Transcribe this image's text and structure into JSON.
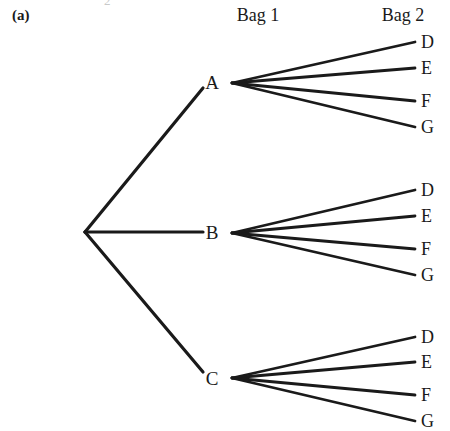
{
  "figure": {
    "part_label": "(a)",
    "top_artifact": "2",
    "background_color": "#ffffff",
    "line_color": "#1a1a1a",
    "text_color": "#1a1a1a"
  },
  "headers": [
    {
      "name": "bag-1",
      "label": "Bag 1",
      "x": 258
    },
    {
      "name": "bag-2",
      "label": "Bag 2",
      "x": 403
    }
  ],
  "root": {
    "x": 85,
    "y": 232
  },
  "stage1": [
    {
      "id": "A",
      "label": "A",
      "x": 212,
      "y": 82,
      "fan_x": 232,
      "fan_y": 83,
      "line_end_x": 203,
      "line_end_y": 88
    },
    {
      "id": "B",
      "label": "B",
      "x": 212,
      "y": 232,
      "fan_x": 232,
      "fan_y": 233,
      "line_end_x": 203,
      "line_end_y": 232
    },
    {
      "id": "C",
      "label": "C",
      "x": 212,
      "y": 378,
      "fan_x": 232,
      "fan_y": 378,
      "line_end_x": 203,
      "line_end_y": 372
    }
  ],
  "stage2": [
    {
      "parent": "A",
      "leaves": [
        {
          "label": "D",
          "y": 42,
          "line_x": 415,
          "text_x": 421
        },
        {
          "label": "E",
          "y": 68,
          "line_x": 415,
          "text_x": 421
        },
        {
          "label": "F",
          "y": 101,
          "line_x": 415,
          "text_x": 421
        },
        {
          "label": "G",
          "y": 127,
          "line_x": 415,
          "text_x": 421
        }
      ]
    },
    {
      "parent": "B",
      "leaves": [
        {
          "label": "D",
          "y": 190,
          "line_x": 415,
          "text_x": 421
        },
        {
          "label": "E",
          "y": 216,
          "line_x": 415,
          "text_x": 421
        },
        {
          "label": "F",
          "y": 249,
          "line_x": 415,
          "text_x": 421
        },
        {
          "label": "G",
          "y": 275,
          "line_x": 415,
          "text_x": 421
        }
      ]
    },
    {
      "parent": "C",
      "leaves": [
        {
          "label": "D",
          "y": 337,
          "line_x": 415,
          "text_x": 421
        },
        {
          "label": "E",
          "y": 362,
          "line_x": 415,
          "text_x": 421
        },
        {
          "label": "F",
          "y": 395,
          "line_x": 415,
          "text_x": 421
        },
        {
          "label": "G",
          "y": 421,
          "line_x": 415,
          "text_x": 421
        }
      ]
    }
  ]
}
